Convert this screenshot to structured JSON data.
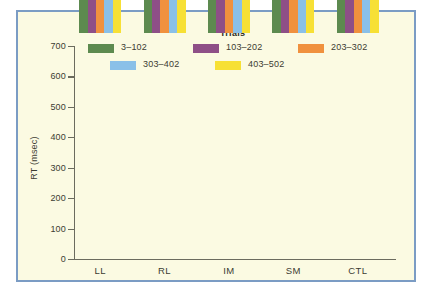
{
  "chart_data": {
    "type": "bar",
    "title": "",
    "xlabel": "",
    "ylabel": "RT (msec)",
    "ylim": [
      0,
      700
    ],
    "yticks": [
      0,
      100,
      200,
      300,
      400,
      500,
      600,
      700
    ],
    "ytick_labels": [
      "0",
      "100",
      "200",
      "300",
      "400",
      "500",
      "600",
      "700"
    ],
    "grid": false,
    "legend_title": "Trials",
    "legend_position": "top",
    "categories": [
      "LL",
      "RL",
      "IM",
      "SM",
      "CTL"
    ],
    "series": [
      {
        "name": "3–102",
        "color": "#5d8a4f",
        "values": [
          481,
          500,
          520,
          657,
          487
        ]
      },
      {
        "name": "103–202",
        "color": "#8e4f87",
        "values": [
          483,
          485,
          499,
          651,
          475
        ]
      },
      {
        "name": "203–302",
        "color": "#f0913e",
        "values": [
          477,
          491,
          507,
          661,
          481
        ]
      },
      {
        "name": "303–402",
        "color": "#8ac0e8",
        "values": [
          484,
          481,
          521,
          655,
          486
        ]
      },
      {
        "name": "403–502",
        "color": "#f7e035",
        "values": [
          486,
          488,
          513,
          668,
          489
        ]
      }
    ]
  },
  "figure": {
    "frame_color": "#7b9cc4",
    "background_color": "#fbfae2",
    "axis_color": "#6b6b5e",
    "text_color": "#3c3c32"
  }
}
